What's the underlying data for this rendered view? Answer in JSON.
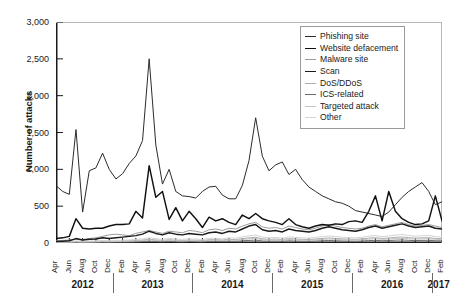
{
  "chart_data": {
    "type": "line",
    "title": "",
    "xlabel": "",
    "ylabel": "Number of attacks",
    "ylim": [
      0,
      3000
    ],
    "ytick_values": [
      0,
      500,
      1000,
      1500,
      2000,
      2500,
      3000
    ],
    "ytick_labels": [
      "0",
      "500",
      "1,000",
      "1,500",
      "2,000",
      "2,500",
      "3,000"
    ],
    "grid": false,
    "legend_position": "top-right",
    "x": [
      "Apr 2012",
      "May 2012",
      "Jun 2012",
      "Jul 2012",
      "Aug 2012",
      "Sep 2012",
      "Oct 2012",
      "Nov 2012",
      "Dec 2012",
      "Jan 2013",
      "Feb 2013",
      "Mar 2013",
      "Apr 2013",
      "May 2013",
      "Jun 2013",
      "Jul 2013",
      "Aug 2013",
      "Sep 2013",
      "Oct 2013",
      "Nov 2013",
      "Dec 2013",
      "Jan 2014",
      "Feb 2014",
      "Mar 2014",
      "Apr 2014",
      "May 2014",
      "Jun 2014",
      "Jul 2014",
      "Aug 2014",
      "Sep 2014",
      "Oct 2014",
      "Nov 2014",
      "Dec 2014",
      "Jan 2015",
      "Feb 2015",
      "Mar 2015",
      "Apr 2015",
      "May 2015",
      "Jun 2015",
      "Jul 2015",
      "Aug 2015",
      "Sep 2015",
      "Oct 2015",
      "Nov 2015",
      "Dec 2015",
      "Jan 2016",
      "Feb 2016",
      "Mar 2016",
      "Apr 2016",
      "May 2016",
      "Jun 2016",
      "Jul 2016",
      "Aug 2016",
      "Sep 2016",
      "Oct 2016",
      "Nov 2016",
      "Dec 2016",
      "Jan 2017",
      "Feb 2017"
    ],
    "xtick_labels": [
      "Apr",
      "Jun",
      "Aug",
      "Oct",
      "Dec",
      "Feb",
      "Apr",
      "Jun",
      "Aug",
      "Oct",
      "Dec",
      "Feb",
      "Apr",
      "Jun",
      "Aug",
      "Oct",
      "Dec",
      "Feb",
      "Apr",
      "Jun",
      "Aug",
      "Oct",
      "Dec",
      "Feb",
      "Apr",
      "Jun",
      "Aug",
      "Oct",
      "Dec",
      "Feb"
    ],
    "xtick_indices": [
      0,
      2,
      4,
      6,
      8,
      10,
      12,
      14,
      16,
      18,
      20,
      22,
      24,
      26,
      28,
      30,
      32,
      34,
      36,
      38,
      40,
      42,
      44,
      46,
      48,
      50,
      52,
      54,
      56,
      58
    ],
    "year_bands": [
      {
        "label": "2012",
        "start_index": 0,
        "end_index": 8
      },
      {
        "label": "2013",
        "start_index": 9,
        "end_index": 20
      },
      {
        "label": "2014",
        "start_index": 21,
        "end_index": 32
      },
      {
        "label": "2015",
        "start_index": 33,
        "end_index": 44
      },
      {
        "label": "2016",
        "start_index": 45,
        "end_index": 56
      },
      {
        "label": "2017",
        "start_index": 57,
        "end_index": 58
      }
    ],
    "series": [
      {
        "name": "Phishing site",
        "color": "#2b2b2b",
        "width": 1.0,
        "values": [
          780,
          700,
          660,
          1540,
          420,
          980,
          1020,
          1220,
          1000,
          870,
          940,
          1080,
          1180,
          1390,
          2500,
          1330,
          800,
          1000,
          700,
          640,
          630,
          610,
          700,
          760,
          770,
          650,
          600,
          600,
          780,
          1120,
          1700,
          1180,
          980,
          1060,
          1100,
          930,
          1000,
          860,
          760,
          700,
          640,
          600,
          560,
          540,
          500,
          440,
          420,
          400,
          380,
          360,
          420,
          520,
          620,
          700,
          760,
          820,
          700,
          520,
          560
        ]
      },
      {
        "name": "Website defacement",
        "color": "#111111",
        "width": 1.45,
        "values": [
          60,
          70,
          90,
          330,
          200,
          190,
          200,
          200,
          230,
          250,
          250,
          260,
          430,
          340,
          1050,
          620,
          700,
          320,
          480,
          300,
          430,
          330,
          210,
          350,
          300,
          330,
          280,
          250,
          380,
          330,
          400,
          330,
          300,
          280,
          250,
          330,
          250,
          220,
          200,
          230,
          250,
          240,
          260,
          250,
          290,
          300,
          280,
          430,
          640,
          300,
          700,
          430,
          330,
          280,
          250,
          260,
          300,
          640,
          300
        ]
      },
      {
        "name": "Malware site",
        "color": "#9b9b9b",
        "width": 1.0,
        "values": [
          30,
          35,
          40,
          50,
          45,
          60,
          70,
          90,
          110,
          120,
          110,
          100,
          130,
          150,
          170,
          150,
          130,
          160,
          150,
          140,
          170,
          160,
          140,
          180,
          190,
          170,
          200,
          190,
          230,
          260,
          280,
          220,
          200,
          210,
          190,
          230,
          210,
          190,
          180,
          200,
          230,
          250,
          230,
          210,
          200,
          190,
          200,
          230,
          250,
          220,
          240,
          260,
          280,
          250,
          230,
          240,
          250,
          230,
          210
        ]
      },
      {
        "name": "Scan",
        "color": "#1a1a1a",
        "width": 1.45,
        "values": [
          20,
          25,
          30,
          60,
          40,
          50,
          55,
          70,
          60,
          70,
          80,
          90,
          100,
          120,
          160,
          130,
          110,
          140,
          120,
          110,
          130,
          120,
          110,
          140,
          150,
          130,
          160,
          150,
          190,
          230,
          250,
          180,
          160,
          170,
          150,
          190,
          170,
          160,
          150,
          170,
          200,
          220,
          200,
          180,
          170,
          160,
          180,
          210,
          230,
          200,
          220,
          240,
          260,
          230,
          210,
          220,
          230,
          200,
          190
        ]
      },
      {
        "name": "DoS/DDoS",
        "color": "#adadad",
        "width": 1.0,
        "values": [
          10,
          12,
          14,
          20,
          16,
          18,
          20,
          24,
          22,
          26,
          28,
          30,
          34,
          40,
          50,
          42,
          36,
          44,
          38,
          34,
          40,
          38,
          34,
          44,
          46,
          40,
          50,
          46,
          60,
          70,
          78,
          56,
          50,
          54,
          48,
          60,
          54,
          50,
          46,
          54,
          62,
          68,
          62,
          56,
          52,
          50,
          56,
          66,
          72,
          62,
          68,
          76,
          82,
          72,
          66,
          70,
          72,
          62,
          58
        ]
      },
      {
        "name": "ICS-related",
        "color": "#6f6f6f",
        "width": 1.0,
        "values": [
          5,
          6,
          7,
          10,
          8,
          9,
          10,
          12,
          11,
          13,
          14,
          15,
          17,
          20,
          25,
          21,
          18,
          22,
          19,
          17,
          20,
          19,
          17,
          22,
          23,
          20,
          25,
          23,
          30,
          35,
          39,
          28,
          25,
          27,
          24,
          30,
          27,
          25,
          23,
          27,
          31,
          34,
          31,
          28,
          26,
          25,
          28,
          33,
          36,
          31,
          34,
          38,
          41,
          36,
          33,
          35,
          36,
          31,
          29
        ]
      },
      {
        "name": "Targeted attack",
        "color": "#c4c4c4",
        "width": 1.0,
        "values": [
          8,
          9,
          11,
          16,
          13,
          14,
          16,
          19,
          18,
          21,
          22,
          24,
          27,
          32,
          40,
          34,
          29,
          35,
          30,
          27,
          32,
          30,
          27,
          35,
          37,
          32,
          40,
          37,
          48,
          56,
          62,
          45,
          40,
          43,
          38,
          48,
          43,
          40,
          37,
          43,
          50,
          54,
          50,
          45,
          42,
          40,
          45,
          53,
          58,
          50,
          54,
          61,
          66,
          58,
          53,
          56,
          58,
          50,
          46
        ]
      },
      {
        "name": "Other",
        "color": "#d4d4d4",
        "width": 1.0,
        "values": [
          15,
          18,
          20,
          28,
          24,
          26,
          28,
          34,
          31,
          37,
          39,
          42,
          48,
          56,
          70,
          60,
          51,
          62,
          53,
          48,
          56,
          53,
          48,
          62,
          65,
          56,
          70,
          65,
          84,
          98,
          109,
          79,
          70,
          75,
          67,
          84,
          75,
          70,
          65,
          75,
          87,
          95,
          87,
          79,
          73,
          70,
          79,
          93,
          102,
          87,
          95,
          107,
          116,
          102,
          93,
          98,
          102,
          87,
          81
        ]
      }
    ]
  }
}
